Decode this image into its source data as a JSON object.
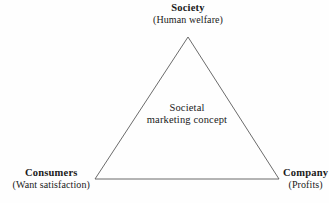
{
  "diagram": {
    "background_color": "#fefefe",
    "line_color": "#5a5a5a",
    "text_color": "#1a1a1a",
    "shape": "triangle",
    "vertices": {
      "top": {
        "x": 188,
        "y": 37
      },
      "bottom_left": {
        "x": 95,
        "y": 179
      },
      "bottom_right": {
        "x": 279,
        "y": 179
      }
    },
    "nodes": {
      "society": {
        "title": "Society",
        "subtitle": "(Human welfare)",
        "position": "top"
      },
      "consumers": {
        "title": "Consumers",
        "subtitle": "(Want satisfaction)",
        "position": "bottom-left"
      },
      "company": {
        "title": "Company",
        "subtitle": "(Profits)",
        "position": "bottom-right"
      }
    },
    "center": {
      "line1": "Societal",
      "line2": "marketing concept"
    }
  }
}
